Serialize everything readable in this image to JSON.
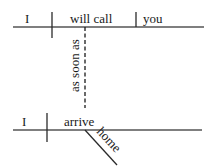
{
  "diagram": {
    "type": "sentence-diagram",
    "main_clause": {
      "subject": "I",
      "verb": "will call",
      "object": "you"
    },
    "connector": "as soon as",
    "subordinate_clause": {
      "subject": "I",
      "verb": "arrive",
      "modifier": "home"
    },
    "colors": {
      "line": "#2a2a2a",
      "text": "#1a1a1a",
      "background": "#ffffff"
    }
  }
}
